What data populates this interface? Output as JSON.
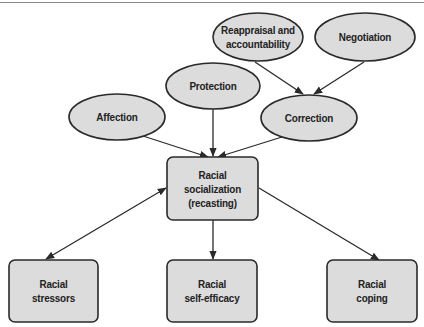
{
  "diagram": {
    "colors": {
      "node_fill": "#dcdcdc",
      "node_stroke": "#2a2a2a",
      "edge": "#2a2a2a",
      "text": "#222222",
      "top_rule": "#8a8a8a"
    },
    "nodes": {
      "reappraisal": {
        "shape": "ellipse",
        "label": "Reappraisal and\naccountability"
      },
      "negotiation": {
        "shape": "ellipse",
        "label": "Negotiation"
      },
      "protection": {
        "shape": "ellipse",
        "label": "Protection"
      },
      "affection": {
        "shape": "ellipse",
        "label": "Affection"
      },
      "correction": {
        "shape": "ellipse",
        "label": "Correction"
      },
      "socialization": {
        "shape": "rounded-rect",
        "label": "Racial\nsocialization\n(recasting)"
      },
      "stressors": {
        "shape": "rounded-rect",
        "label": "Racial\nstressors"
      },
      "self_efficacy": {
        "shape": "rounded-rect",
        "label": "Racial\nself-efficacy"
      },
      "coping": {
        "shape": "rounded-rect",
        "label": "Racial\ncoping"
      }
    },
    "edges": [
      {
        "from": "reappraisal",
        "to": "correction",
        "direction": "forward"
      },
      {
        "from": "negotiation",
        "to": "correction",
        "direction": "forward"
      },
      {
        "from": "affection",
        "to": "socialization",
        "direction": "forward"
      },
      {
        "from": "protection",
        "to": "socialization",
        "direction": "forward"
      },
      {
        "from": "correction",
        "to": "socialization",
        "direction": "forward"
      },
      {
        "from": "socialization",
        "to": "stressors",
        "direction": "bidirectional"
      },
      {
        "from": "socialization",
        "to": "self_efficacy",
        "direction": "forward"
      },
      {
        "from": "socialization",
        "to": "coping",
        "direction": "forward"
      }
    ]
  }
}
